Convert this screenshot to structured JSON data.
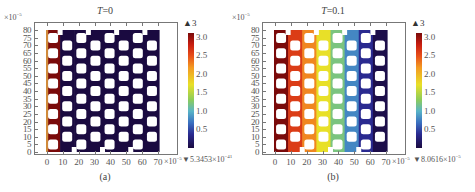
{
  "chart_data": [
    {
      "type": "heatmap",
      "panel": "(a)",
      "title": "T=0",
      "title_var": "T",
      "title_value": "=0",
      "x_exponent": "×10",
      "x_exponent_power": "−5",
      "y_exponent": "×10",
      "y_exponent_power": "−5",
      "xticks": [
        "0",
        "10",
        "20",
        "30",
        "40",
        "50",
        "60",
        "70"
      ],
      "yticks": [
        "80",
        "75",
        "70",
        "65",
        "60",
        "55",
        "50",
        "45",
        "40",
        "35",
        "30",
        "25",
        "20",
        "15",
        "10",
        "5",
        "0"
      ],
      "xlim": [
        0,
        70
      ],
      "ylim": [
        0,
        80
      ],
      "colorbar": {
        "ticks": [
          "3.0",
          "2.5",
          "2.0",
          "1.5",
          "1.0",
          "0.5"
        ],
        "max_label": "▲3",
        "min_label": "▼5.3453×10",
        "min_power": "−41",
        "range": [
          0,
          3
        ]
      },
      "description": "Porous lattice geometry; concentration ~0 everywhere except inlet boundary at x=0 (value ~3).",
      "column_values": [
        3,
        0,
        0,
        0,
        0,
        0,
        0,
        0
      ]
    },
    {
      "type": "heatmap",
      "panel": "(b)",
      "title": "T=0.1",
      "title_var": "T",
      "title_value": "=0.1",
      "x_exponent": "×10",
      "x_exponent_power": "−5",
      "y_exponent": "×10",
      "y_exponent_power": "−5",
      "xticks": [
        "0",
        "10",
        "20",
        "30",
        "40",
        "50",
        "60",
        "70"
      ],
      "yticks": [
        "80",
        "75",
        "70",
        "65",
        "60",
        "55",
        "50",
        "45",
        "40",
        "35",
        "30",
        "25",
        "20",
        "15",
        "10",
        "5",
        "0"
      ],
      "xlim": [
        0,
        70
      ],
      "ylim": [
        0,
        80
      ],
      "colorbar": {
        "ticks": [
          "3.0",
          "2.5",
          "2.0",
          "1.5",
          "1.0",
          "0.5"
        ],
        "max_label": "▲3",
        "min_label": "▼8.0616×10",
        "min_power": "−5",
        "range": [
          0,
          3
        ]
      },
      "description": "Concentration decreasing linearly from ~3 at x=0 to ~0 at x=70 across porous lattice.",
      "column_values": [
        3.0,
        2.6,
        2.2,
        1.8,
        1.3,
        0.9,
        0.4,
        0.05
      ]
    }
  ]
}
